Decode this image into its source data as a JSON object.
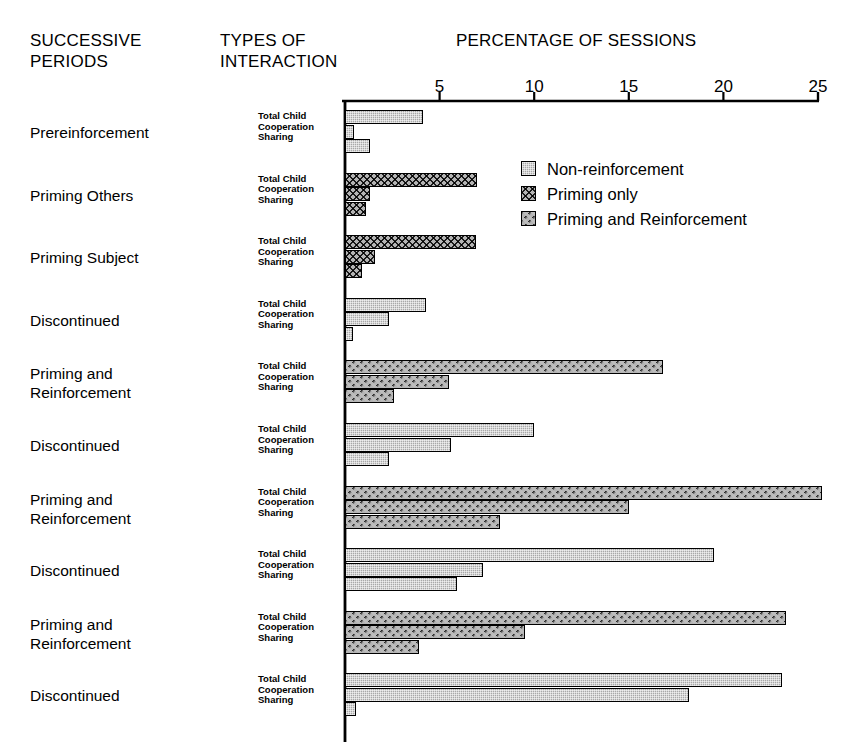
{
  "headers": {
    "periods": "SUCCESSIVE\nPERIODS",
    "types": "TYPES OF\nINTERACTION",
    "percentage": "PERCENTAGE OF SESSIONS"
  },
  "axis": {
    "ticks": [
      "5",
      "10",
      "15",
      "20",
      "25"
    ],
    "min": 0,
    "max": 25
  },
  "legend": [
    {
      "label": "Non-reinforcement",
      "key": "non-reinforcement",
      "color": "#a8a8a8"
    },
    {
      "label": "Priming only",
      "key": "priming-only",
      "color": "#b4b4b4"
    },
    {
      "label": "Priming and Reinforcement",
      "key": "priming-and-reinforcement",
      "color": "#1a1a1a"
    }
  ],
  "row_labels": [
    "Total Child",
    "Cooperation",
    "Sharing"
  ],
  "chart_data": {
    "type": "bar",
    "orientation": "horizontal",
    "title": "PERCENTAGE OF SESSIONS",
    "xlabel": "PERCENTAGE OF SESSIONS",
    "ylabel": "SUCCESSIVE PERIODS",
    "xlim": [
      0,
      25
    ],
    "xticks": [
      5,
      10,
      15,
      20,
      25
    ],
    "grid": false,
    "legend_position": "top-right",
    "subgroups": [
      "Total Child",
      "Cooperation",
      "Sharing"
    ],
    "series": [
      {
        "name": "Non-reinforcement",
        "pattern": "light-stipple"
      },
      {
        "name": "Priming only",
        "pattern": "light-crosshatch"
      },
      {
        "name": "Priming and Reinforcement",
        "pattern": "dark-crosshatch"
      }
    ],
    "groups": [
      {
        "period": "Prereinforcement",
        "series": "Non-reinforcement",
        "values": {
          "Total Child": 4.1,
          "Cooperation": 0.5,
          "Sharing": 1.3
        }
      },
      {
        "period": "Priming Others",
        "series": "Priming only",
        "values": {
          "Total Child": 7.0,
          "Cooperation": 1.3,
          "Sharing": 1.1
        }
      },
      {
        "period": "Priming Subject",
        "series": "Priming only",
        "values": {
          "Total Child": 6.9,
          "Cooperation": 1.6,
          "Sharing": 0.9
        }
      },
      {
        "period": "Discontinued",
        "series": "Non-reinforcement",
        "values": {
          "Total Child": 4.3,
          "Cooperation": 2.3,
          "Sharing": 0.4
        }
      },
      {
        "period": "Priming and\nReinforcement",
        "series": "Priming and Reinforcement",
        "values": {
          "Total Child": 16.8,
          "Cooperation": 5.5,
          "Sharing": 2.6
        }
      },
      {
        "period": "Discontinued",
        "series": "Non-reinforcement",
        "values": {
          "Total Child": 10.0,
          "Cooperation": 5.6,
          "Sharing": 2.3
        }
      },
      {
        "period": "Priming and\nReinforcement",
        "series": "Priming and Reinforcement",
        "values": {
          "Total Child": 25.2,
          "Cooperation": 15.0,
          "Sharing": 8.2
        }
      },
      {
        "period": "Discontinued",
        "series": "Non-reinforcement",
        "values": {
          "Total Child": 19.5,
          "Cooperation": 7.3,
          "Sharing": 5.9
        }
      },
      {
        "period": "Priming and\nReinforcement",
        "series": "Priming and Reinforcement",
        "values": {
          "Total Child": 23.3,
          "Cooperation": 9.5,
          "Sharing": 3.9
        }
      },
      {
        "period": "Discontinued",
        "series": "Non-reinforcement",
        "values": {
          "Total Child": 23.1,
          "Cooperation": 18.2,
          "Sharing": 0.6
        }
      }
    ]
  }
}
